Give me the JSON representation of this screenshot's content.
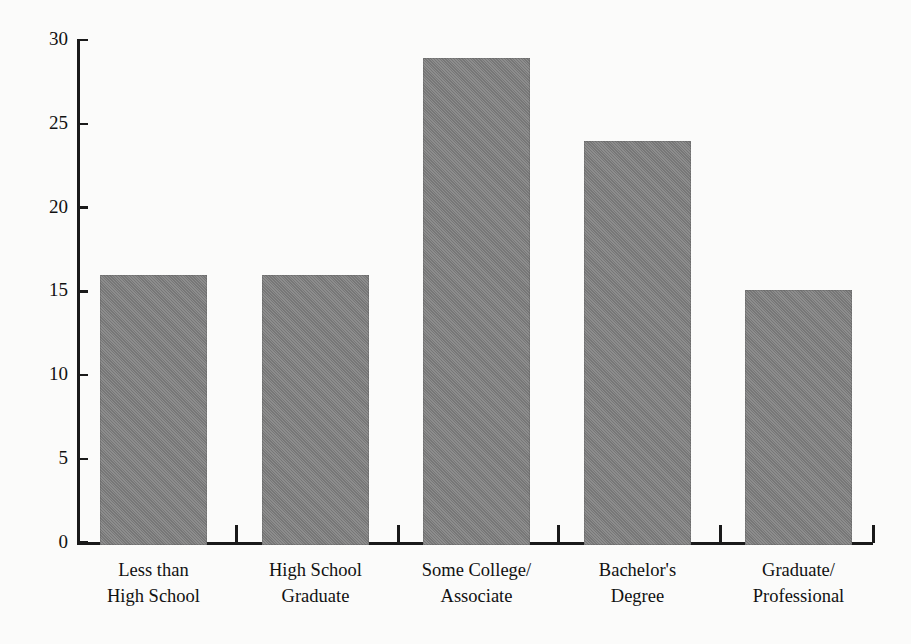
{
  "chart_data": {
    "type": "bar",
    "title": "",
    "subtitle": "",
    "xlabel": "",
    "ylabel": "",
    "categories": [
      "Less than\nHigh School",
      "High School\nGraduate",
      "Some College/\nAssociate",
      "Bachelor's\nDegree",
      "Graduate/\nProfessional"
    ],
    "values": [
      16.1,
      16.1,
      29.1,
      24.1,
      15.2
    ],
    "ylim": [
      0,
      30
    ],
    "yticks": [
      0,
      5,
      10,
      15,
      20,
      25,
      30
    ],
    "ytick_labels": [
      "0",
      "5",
      "10",
      "15",
      "20",
      "25",
      "30"
    ],
    "grid": false,
    "legend": null,
    "bar_color": "#808080",
    "axis_color": "#1a1a1a",
    "background_color": "#fbfbfa"
  },
  "axis": {
    "y_tick_labels": [
      "30",
      "25",
      "20",
      "15",
      "10",
      "5",
      "0"
    ]
  },
  "bars": [
    {
      "label": "Less than\nHigh School",
      "value": 16.1
    },
    {
      "label": "High School\nGraduate",
      "value": 16.1
    },
    {
      "label": "Some College/\nAssociate",
      "value": 29.1
    },
    {
      "label": "Bachelor's\nDegree",
      "value": 24.1
    },
    {
      "label": "Graduate/\nProfessional",
      "value": 15.2
    }
  ]
}
